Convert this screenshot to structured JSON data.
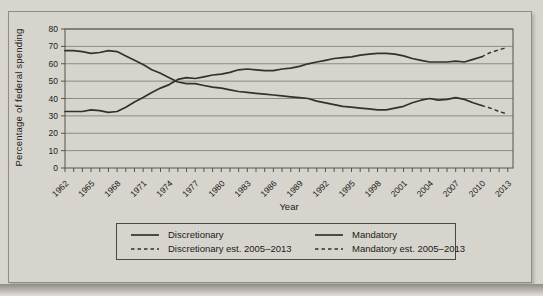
{
  "figure": {
    "background": "#d7d4ce",
    "line_color": "#33312e",
    "grid_color": "#8c8a85",
    "axis_color": "#55534e",
    "text_color": "#1b1a18"
  },
  "chart_data": {
    "type": "line",
    "title": "",
    "xlabel": "Year",
    "ylabel": "Percentage of federal spending",
    "ylim": [
      0,
      80
    ],
    "yticks": [
      0,
      10,
      20,
      30,
      40,
      50,
      60,
      70,
      80
    ],
    "xlim": [
      1962,
      2013.6
    ],
    "xtick_labels": [
      "1962",
      "1965",
      "1968",
      "1971",
      "1974",
      "1977",
      "1980",
      "1983",
      "1986",
      "1989",
      "1992",
      "1995",
      "1998",
      "2001",
      "2004",
      "2007",
      "2010",
      "2013"
    ],
    "minor_tick_years": [
      1962,
      2013
    ],
    "grid": "horizontal",
    "legend_position": "bottom",
    "series": [
      {
        "name": "Discretionary",
        "style": "solid",
        "x": [
          1962,
          1963,
          1964,
          1965,
          1966,
          1967,
          1968,
          1969,
          1970,
          1971,
          1972,
          1973,
          1974,
          1975,
          1976,
          1977,
          1978,
          1979,
          1980,
          1981,
          1982,
          1983,
          1984,
          1985,
          1986,
          1987,
          1988,
          1989,
          1990,
          1991,
          1992,
          1993,
          1994,
          1995,
          1996,
          1997,
          1998,
          1999,
          2000,
          2001,
          2002,
          2003,
          2004,
          2005,
          2006,
          2007,
          2008,
          2009,
          2010
        ],
        "values": [
          67.5,
          67.5,
          67.0,
          66.0,
          66.5,
          67.5,
          67.0,
          64.5,
          62.0,
          59.5,
          56.5,
          54.5,
          52.0,
          49.5,
          48.5,
          48.5,
          47.5,
          46.5,
          46.0,
          45.0,
          44.0,
          43.5,
          43.0,
          42.5,
          42.0,
          41.5,
          41.0,
          40.5,
          40.0,
          38.5,
          37.5,
          36.5,
          35.5,
          35.0,
          34.5,
          34.0,
          33.5,
          33.5,
          34.5,
          35.5,
          37.5,
          39.0,
          40.0,
          39.0,
          39.5,
          40.5,
          39.5,
          37.5,
          36.0
        ]
      },
      {
        "name": "Mandatory",
        "style": "solid",
        "x": [
          1962,
          1963,
          1964,
          1965,
          1966,
          1967,
          1968,
          1969,
          1970,
          1971,
          1972,
          1973,
          1974,
          1975,
          1976,
          1977,
          1978,
          1979,
          1980,
          1981,
          1982,
          1983,
          1984,
          1985,
          1986,
          1987,
          1988,
          1989,
          1990,
          1991,
          1992,
          1993,
          1994,
          1995,
          1996,
          1997,
          1998,
          1999,
          2000,
          2001,
          2002,
          2003,
          2004,
          2005,
          2006,
          2007,
          2008,
          2009,
          2010
        ],
        "values": [
          32.5,
          32.5,
          32.5,
          33.5,
          33.0,
          32.0,
          32.5,
          35.0,
          38.0,
          40.5,
          43.5,
          46.0,
          48.0,
          51.0,
          52.0,
          51.5,
          52.5,
          53.5,
          54.0,
          55.0,
          56.5,
          57.0,
          56.5,
          56.0,
          56.0,
          57.0,
          57.5,
          58.5,
          60.0,
          61.0,
          62.0,
          63.0,
          63.5,
          64.0,
          65.0,
          65.5,
          66.0,
          66.0,
          65.5,
          64.5,
          63.0,
          62.0,
          61.0,
          61.0,
          61.0,
          61.5,
          61.0,
          62.5,
          64.0
        ]
      },
      {
        "name": "Discretionary est. 2005–2013",
        "style": "dashed",
        "x": [
          2010,
          2011,
          2012,
          2013
        ],
        "values": [
          36.0,
          34.5,
          32.5,
          31.0
        ]
      },
      {
        "name": "Mandatory est. 2005–2013",
        "style": "dashed",
        "x": [
          2010,
          2011,
          2012,
          2013
        ],
        "values": [
          64.0,
          66.5,
          68.0,
          69.5
        ]
      }
    ]
  },
  "legend": {
    "items": [
      {
        "label": "Discretionary",
        "style": "solid"
      },
      {
        "label": "Mandatory",
        "style": "solid"
      },
      {
        "label": "Discretionary est. 2005–2013",
        "style": "dashed"
      },
      {
        "label": "Mandatory est. 2005–2013",
        "style": "dashed"
      }
    ]
  }
}
